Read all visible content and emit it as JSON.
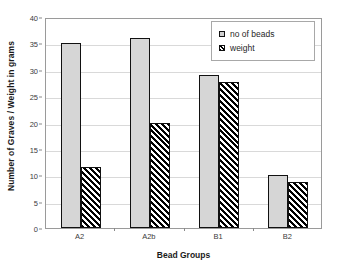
{
  "chart_data": {
    "type": "bar",
    "title": "",
    "subtitle": "",
    "xlabel": "Bead Groups",
    "ylabel": "Number of Graves / Weight in grams",
    "categories": [
      "A2",
      "A2b",
      "B1",
      "B2"
    ],
    "series": [
      {
        "name": "no of beads",
        "values": [
          35,
          36,
          29,
          10
        ],
        "fill": "light-gray-stipple",
        "color": "#d6d6d6"
      },
      {
        "name": "weight",
        "values": [
          11.5,
          20,
          27.7,
          8.8
        ],
        "fill": "black-diagonal-hatch",
        "color": "#000000"
      }
    ],
    "ylim": [
      0,
      40
    ],
    "yticks": [
      0,
      5,
      10,
      15,
      20,
      25,
      30,
      35,
      40
    ],
    "ytick_labels": [
      "0",
      "5",
      "10",
      "15",
      "20",
      "25",
      "30",
      "35",
      "40"
    ],
    "grid": true,
    "grid_axis": "y",
    "grid_color": "#d9d9d9",
    "legend": true,
    "legend_position": "top-right-inside",
    "legend_entries": [
      "no of beads",
      "weight"
    ],
    "plot_border_color": "#9a9a9a",
    "background": "#ffffff",
    "bar_edge_color": "#111111"
  }
}
